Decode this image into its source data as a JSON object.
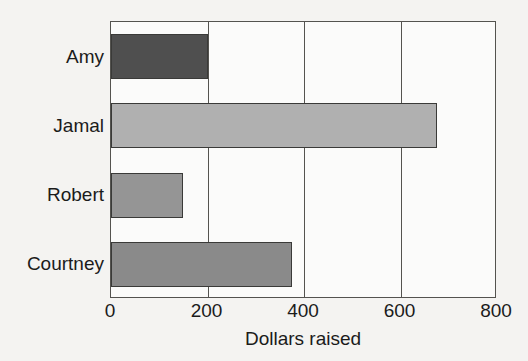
{
  "chart_data": {
    "type": "bar",
    "orientation": "horizontal",
    "title": "",
    "xlabel": "Dollars raised",
    "ylabel": "",
    "categories": [
      "Amy",
      "Jamal",
      "Robert",
      "Courtney"
    ],
    "values": [
      200,
      675,
      150,
      375
    ],
    "xlim": [
      0,
      800
    ],
    "xticks": [
      0,
      200,
      400,
      600,
      800
    ],
    "xtick_labels": [
      "0",
      "200",
      "400",
      "600",
      "800"
    ],
    "grid": true,
    "grid_axis": "x",
    "legend": false,
    "bar_colors": [
      "#4f4f4f",
      "#b0b0b0",
      "#959595",
      "#8a8a8a"
    ],
    "bars": [
      {
        "category": "Amy",
        "value": 200,
        "color": "#4f4f4f"
      },
      {
        "category": "Jamal",
        "value": 675,
        "color": "#b0b0b0"
      },
      {
        "category": "Robert",
        "value": 150,
        "color": "#959595"
      },
      {
        "category": "Courtney",
        "value": 375,
        "color": "#8a8a8a"
      }
    ]
  },
  "style": {
    "background": "#f4f3f1",
    "plot_background": "#fbfbfa",
    "axis_color": "#54534f",
    "bar_edge_color": "#3a3a38",
    "text_color": "#1b1b1b"
  }
}
